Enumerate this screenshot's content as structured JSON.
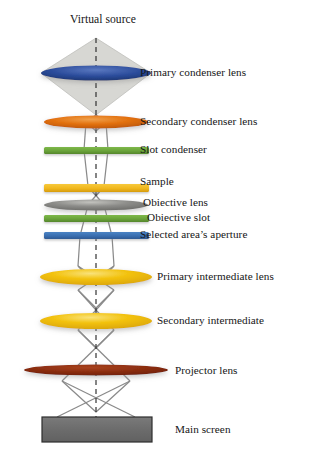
{
  "figure": {
    "title": "Virtual source",
    "type": "optical-ray-diagram",
    "background_color": "#ffffff",
    "text_color": "#161616",
    "optical_axis": {
      "style": "dashed",
      "color": "#2b2b2b",
      "x": 96,
      "y_top": 38,
      "y_bottom": 424
    },
    "beam_color": "#8a8a8a",
    "cone_fill": "#d7d7d3"
  },
  "elements": [
    {
      "id": "virtual-source",
      "label": "Virtual source",
      "kind": "text-title",
      "label_x": 70,
      "label_y": 14,
      "cx": 96,
      "cy": 38
    },
    {
      "id": "primary-condenser-lens",
      "label": "Primary condenser lens",
      "kind": "lens-ellipse",
      "color": "#2b4c9b",
      "highlight": "#5a78c0",
      "cx": 96,
      "cy": 73,
      "rx": 55,
      "ry": 7.5,
      "label_x": 140,
      "label_y": 66
    },
    {
      "id": "secondary-condenser-lens",
      "label": "Secondary condenser lens",
      "kind": "lens-ellipse",
      "color": "#e2700d",
      "highlight": "#f0a04b",
      "cx": 96,
      "cy": 122,
      "rx": 52,
      "ry": 6.5,
      "label_x": 140,
      "label_y": 115
    },
    {
      "id": "slot-condenser",
      "label": "Slot condenser",
      "kind": "bar",
      "color": "#6aa33a",
      "x": 44,
      "y": 147,
      "width": 105,
      "height": 7,
      "label_x": 140,
      "label_y": 143
    },
    {
      "id": "sample",
      "label": "Sample",
      "kind": "bar",
      "color": "#f0b71e",
      "x": 44,
      "y": 184,
      "width": 105,
      "height": 8,
      "label_x": 140,
      "label_y": 175
    },
    {
      "id": "objective-lens",
      "label": "Obiective lens",
      "kind": "lens-ellipse",
      "color": "#7d7d7a",
      "highlight": "#b6b6b2",
      "cx": 96,
      "cy": 205,
      "rx": 52,
      "ry": 5.5,
      "label_x": 143,
      "label_y": 196
    },
    {
      "id": "objective-slot",
      "label": "Obiective slot",
      "kind": "bar",
      "color": "#6aa33a",
      "x": 44,
      "y": 215,
      "width": 105,
      "height": 7,
      "label_x": 147,
      "label_y": 210
    },
    {
      "id": "selected-area-aperture",
      "label": "Selected area’s aperture",
      "kind": "bar",
      "color": "#3a6fb0",
      "x": 44,
      "y": 232,
      "width": 105,
      "height": 7,
      "label_x": 140,
      "label_y": 228
    },
    {
      "id": "primary-intermediate-lens",
      "label": "Primary intermediate lens",
      "kind": "lens-ellipse",
      "color": "#f2c10a",
      "highlight": "#f7da62",
      "cx": 96,
      "cy": 277,
      "rx": 56,
      "ry": 8,
      "label_x": 157,
      "label_y": 270
    },
    {
      "id": "secondary-intermediate",
      "label": "Secondary intermediate",
      "kind": "lens-ellipse",
      "color": "#f2c10a",
      "highlight": "#f7da62",
      "cx": 96,
      "cy": 321,
      "rx": 56,
      "ry": 8,
      "label_x": 157,
      "label_y": 314
    },
    {
      "id": "projector-lens",
      "label": "Projector lens",
      "kind": "lens-ellipse",
      "color": "#8b2d10",
      "highlight": "#a8421d",
      "cx": 96,
      "cy": 370,
      "rx": 72,
      "ry": 5.5,
      "label_x": 175,
      "label_y": 364
    },
    {
      "id": "main-screen",
      "label": "Main screen",
      "kind": "screen-rect",
      "color": "#6e6e6e",
      "border_color": "#2e2e2e",
      "x": 42,
      "y": 417,
      "width": 110,
      "height": 25,
      "label_x": 175,
      "label_y": 423
    }
  ]
}
